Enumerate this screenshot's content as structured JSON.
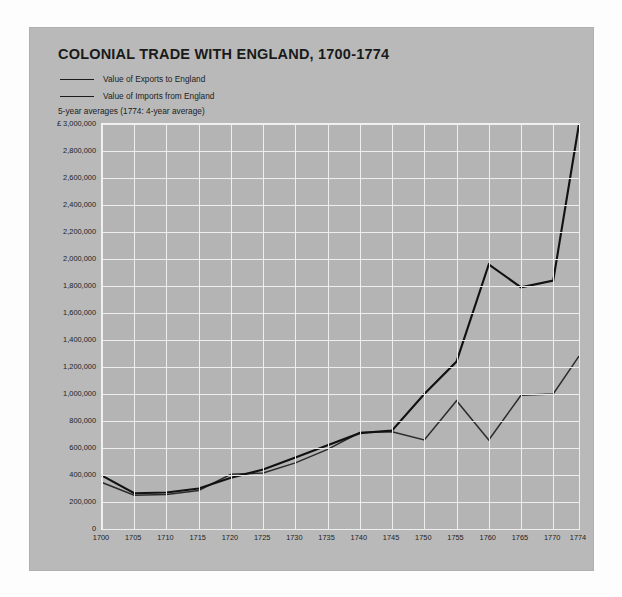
{
  "chart_data": {
    "type": "line",
    "title": "COLONIAL TRADE WITH ENGLAND, 1700-1774",
    "subtitle": "5-year averages (1774: 4-year average)",
    "xlabel": "",
    "ylabel": "",
    "y_axis_prefix": "£ 3,000,000",
    "xlim": [
      1700,
      1774
    ],
    "ylim": [
      0,
      3000000
    ],
    "grid": true,
    "legend_position": "top-left",
    "x": [
      1700,
      1705,
      1710,
      1715,
      1720,
      1725,
      1730,
      1735,
      1740,
      1745,
      1750,
      1755,
      1760,
      1765,
      1770,
      1774
    ],
    "xticks": [
      "1700",
      "1705",
      "1710",
      "1715",
      "1720",
      "1725",
      "1730",
      "1735",
      "1740",
      "1745",
      "1750",
      "1755",
      "1760",
      "1765",
      "1770",
      "1774"
    ],
    "yticks": [
      "£ 3,000,000",
      "2,800,000",
      "2,600,000",
      "2,400,000",
      "2,200,000",
      "2,000,000",
      "1,800,000",
      "1,600,000",
      "1,400,000",
      "1,200,000",
      "1,000,000",
      "800,000",
      "600,000",
      "400,000",
      "200,000",
      "0"
    ],
    "ytick_values": [
      3000000,
      2800000,
      2600000,
      2400000,
      2200000,
      2000000,
      1800000,
      1600000,
      1400000,
      1200000,
      1000000,
      800000,
      600000,
      400000,
      200000,
      0
    ],
    "series": [
      {
        "name": "Value of Exports to England",
        "color": "#2b2b2b",
        "values": [
          345000,
          250000,
          255000,
          285000,
          405000,
          415000,
          490000,
          590000,
          715000,
          720000,
          660000,
          950000,
          660000,
          990000,
          1000000,
          1280000
        ]
      },
      {
        "name": "Value of Imports from England",
        "color": "#111111",
        "values": [
          395000,
          265000,
          270000,
          300000,
          380000,
          440000,
          530000,
          620000,
          710000,
          730000,
          1000000,
          1240000,
          1960000,
          1790000,
          1840000,
          3000000
        ]
      }
    ]
  },
  "legend": [
    {
      "label": "Value of Exports to England"
    },
    {
      "label": "Value of Imports from England"
    }
  ]
}
